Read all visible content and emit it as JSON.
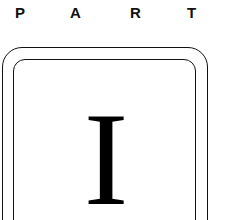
{
  "header": {
    "letters": [
      "P",
      "A",
      "R",
      "T"
    ],
    "word": "PART"
  },
  "frame": {
    "numeral": "I"
  }
}
